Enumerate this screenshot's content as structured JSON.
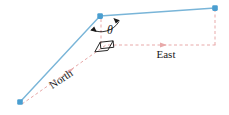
{
  "figure": {
    "type": "vector-angle-diagram",
    "title": "",
    "background_color": "#ffffff",
    "width": 229,
    "height": 115
  },
  "colors": {
    "vector_blue": "#79b5d8",
    "vector_blue_dark": "#4a9ed0",
    "node_blue": "#4a9ed0",
    "reference_pink": "#e8a9a9",
    "annotation_black": "#1a1a1a"
  },
  "labels": {
    "north": "North",
    "east": "East",
    "theta": "θ"
  },
  "nodes": [
    {
      "name": "origin-point",
      "x": 20,
      "y": 102
    },
    {
      "name": "vertex-point",
      "x": 100,
      "y": 16
    },
    {
      "name": "end-point",
      "x": 215,
      "y": 8
    }
  ],
  "vectors": [
    {
      "name": "north-leg",
      "from": "origin-point",
      "to": "vertex-point",
      "color": "#79b5d8"
    },
    {
      "name": "east-leg",
      "from": "vertex-point",
      "to": "end-point",
      "color": "#79b5d8"
    }
  ],
  "reference_lines": [
    {
      "name": "north-reference",
      "label": "North",
      "style": "dashed",
      "color": "#e8a9a9"
    },
    {
      "name": "east-reference",
      "label": "East",
      "style": "dashed",
      "color": "#e8a9a9"
    },
    {
      "name": "vertical-drop",
      "style": "dashed",
      "color": "#e8a9a9"
    },
    {
      "name": "vertex-vertical",
      "style": "dashed",
      "color": "#e8a9a9"
    }
  ],
  "annotations": {
    "angle_arc": {
      "name": "theta-arc",
      "label": "θ",
      "double_headed": true
    },
    "right_angle": {
      "name": "right-angle-marker",
      "present": true
    }
  }
}
